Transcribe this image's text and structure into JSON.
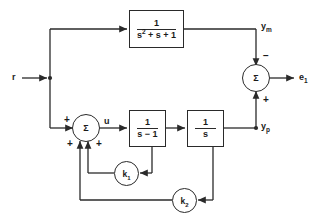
{
  "diagram": {
    "type": "control-block-diagram",
    "stroke_color": "#2a2a2a",
    "text_color": "#1a1a1a",
    "background": "#ffffff"
  },
  "signals": {
    "input_r": "r",
    "model_output_ym": "y",
    "model_output_ym_sub": "m",
    "plant_output_yp": "y",
    "plant_output_yp_sub": "p",
    "control_u": "u",
    "error_e1": "e",
    "error_e1_sub": "1"
  },
  "blocks": [
    {
      "name": "reference-model",
      "numerator": "1",
      "denominator_pre": "s",
      "denominator_exp": "2",
      "denominator_post": "+ s + 1",
      "label_plain": "1/(s^2 + s + 1)"
    },
    {
      "name": "plant-first-order",
      "numerator": "1",
      "denominator": "s − 1",
      "label_plain": "1/(s - 1)"
    },
    {
      "name": "integrator",
      "numerator": "1",
      "denominator": "s",
      "label_plain": "1/s"
    }
  ],
  "gains": [
    {
      "name": "gain-k1",
      "symbol": "k",
      "subscript": "1"
    },
    {
      "name": "gain-k2",
      "symbol": "k",
      "subscript": "2"
    }
  ],
  "summing_junctions": [
    {
      "name": "error-summer",
      "glyph": "Σ",
      "signs": [
        {
          "position": "top",
          "sign": "−"
        },
        {
          "position": "bottom",
          "sign": "+"
        }
      ]
    },
    {
      "name": "control-summer",
      "glyph": "Σ",
      "signs": [
        {
          "position": "left",
          "sign": "+"
        },
        {
          "position": "bottom-left",
          "sign": "+"
        },
        {
          "position": "bottom-right",
          "sign": "+"
        }
      ]
    }
  ]
}
